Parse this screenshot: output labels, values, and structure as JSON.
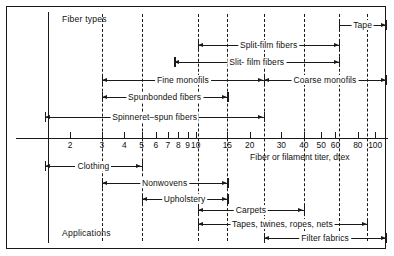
{
  "figure": {
    "top_left_label": "Fiber types",
    "bottom_left_label": "Applications",
    "axis_title": "Fiber or filament titer, dtex"
  },
  "chart_data": {
    "type": "table",
    "xlabel": "Fiber or filament titer, dtex",
    "ylabel": "",
    "scale": "log",
    "xlim": [
      1.45,
      115
    ],
    "grid": false,
    "legend": "none",
    "tick_values": [
      2,
      3,
      4,
      5,
      6,
      7,
      8,
      9,
      10,
      15,
      20,
      30,
      40,
      50,
      60,
      80,
      100
    ],
    "tick_labels": [
      "2",
      "3",
      "4",
      "5",
      "6",
      "7",
      "8",
      "9",
      "10",
      "15",
      "20",
      "30",
      "40",
      "50",
      "60",
      "80",
      "100"
    ],
    "guide_lines": [
      {
        "value": 3,
        "style": "dashed"
      },
      {
        "value": 5,
        "style": "dashed"
      },
      {
        "value": 10.3,
        "style": "dashed"
      },
      {
        "value": 15,
        "style": "dashdot"
      },
      {
        "value": 24,
        "style": "dashdot"
      },
      {
        "value": 40,
        "style": "dashed"
      },
      {
        "value": 63,
        "style": "dashdot"
      },
      {
        "value": 90,
        "style": "dashed"
      }
    ],
    "series": [
      {
        "name": "Tape",
        "group": "fiber-types",
        "label": "Tape",
        "row": 0,
        "from": 63,
        "to": 115,
        "left_end": "bar",
        "right_end": "arrow",
        "dashed_right": false
      },
      {
        "name": "Split-film fibers",
        "group": "fiber-types",
        "label": "Split-film fibers",
        "row": 1,
        "from": 10.3,
        "to": 63,
        "left_end": "arrow",
        "right_end": "arrow",
        "dashed_right": false
      },
      {
        "name": "Slit-film fibers",
        "group": "fiber-types",
        "label": "Slit- film fibers",
        "row": 2,
        "from": 7.6,
        "to": 63,
        "left_end": "arrow",
        "right_end": "arrow",
        "dashed_right": true
      },
      {
        "name": "Fine monofils",
        "group": "fiber-types",
        "label": "Fine monofils",
        "row": 3,
        "from": 3.0,
        "to": 24,
        "left_end": "arrow",
        "right_end": "arrow",
        "dashed_left": true
      },
      {
        "name": "Coarse monofils",
        "group": "fiber-types",
        "label": "Coarse monofils",
        "row": 3,
        "from": 24,
        "to": 115,
        "left_end": "arrow",
        "right_end": "arrow",
        "dashed_right": false
      },
      {
        "name": "Spunbonded fibers",
        "group": "fiber-types",
        "label": "Spunbonded fibers",
        "row": 4,
        "from": 3.0,
        "to": 15,
        "left_end": "arrow",
        "right_end": "arrow"
      },
      {
        "name": "Spinneret-spun fibers",
        "group": "fiber-types",
        "label": "Spinneret–spun fibers",
        "row": 5,
        "from": 1.45,
        "to": 24,
        "left_end": "arrow",
        "right_end": "arrow"
      },
      {
        "name": "Clothing",
        "group": "applications",
        "label": "Clothing",
        "row": 6,
        "from": 1.45,
        "to": 5,
        "left_end": "arrow",
        "right_end": "arrow"
      },
      {
        "name": "Nonwovens",
        "group": "applications",
        "label": "Nonwovens",
        "row": 7,
        "from": 3.0,
        "to": 15,
        "left_end": "arrow",
        "right_end": "arrow"
      },
      {
        "name": "Upholstery",
        "group": "applications",
        "label": "Upholstery",
        "row": 8,
        "from": 5,
        "to": 15,
        "left_end": "arrow",
        "right_end": "arrow"
      },
      {
        "name": "Carpets",
        "group": "applications",
        "label": "Carpets",
        "row": 9,
        "from": 10.3,
        "to": 40,
        "left_end": "arrow",
        "right_end": "arrow",
        "dashed_right": true
      },
      {
        "name": "Tapes, twines, ropes, nets",
        "group": "applications",
        "label": "Tapes, twines, ropes, nets",
        "row": 10,
        "from": 10.3,
        "to": 90,
        "left_end": "arrow",
        "right_end": "arrow",
        "dashed_right": true
      },
      {
        "name": "Filter fabrics",
        "group": "applications",
        "label": "Filter fabrics",
        "row": 11,
        "from": 24,
        "to": 115,
        "left_end": "arrow",
        "right_end": "arrow"
      }
    ]
  }
}
